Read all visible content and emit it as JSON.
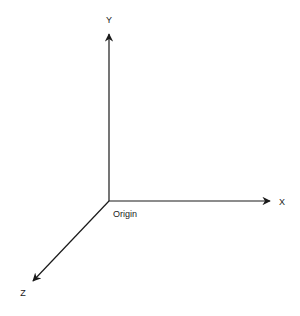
{
  "diagram": {
    "type": "3d-coordinate-axes",
    "axes": [
      {
        "name": "X",
        "label": "X",
        "direction": "right"
      },
      {
        "name": "Y",
        "label": "Y",
        "direction": "up"
      },
      {
        "name": "Z",
        "label": "Z",
        "direction": "down-left"
      }
    ],
    "origin_label": "Origin",
    "colors": {
      "line": "#1a1a1a",
      "background": "#ffffff"
    }
  }
}
